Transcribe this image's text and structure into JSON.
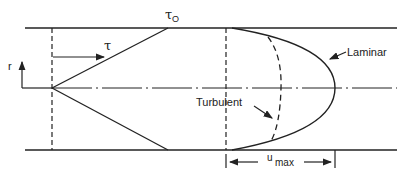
{
  "diagram": {
    "labels": {
      "radius": "r",
      "shear": "τ",
      "wall_shear": "τ",
      "wall_shear_sub": "O",
      "laminar": "Laminar",
      "turbulent": "Turbulent",
      "umax_u": "u",
      "umax_sub": "max"
    },
    "colors": {
      "line": "#222222",
      "background": "#ffffff"
    }
  }
}
